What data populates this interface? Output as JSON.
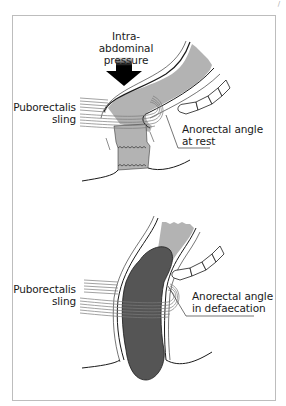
{
  "figure": {
    "corner_mark": "/",
    "colors": {
      "frame": "#bdbdbd",
      "rectum_fill": "#b3b3b3",
      "stool_fill": "#555555",
      "outline": "#1a1a1a",
      "muscle_stripe": "#8a8a8a",
      "background": "#ffffff"
    },
    "panels": [
      {
        "name": "at-rest",
        "labels": {
          "pressure_line1": "Intra-abdominal",
          "pressure_line2": "pressure",
          "sling_line1": "Puborectalis",
          "sling_line2": "sling",
          "angle_line1": "Anorectal angle",
          "angle_line2": "at rest"
        }
      },
      {
        "name": "defaecation",
        "labels": {
          "sling_line1": "Puborectalis",
          "sling_line2": "sling",
          "angle_line1": "Anorectal angle",
          "angle_line2": "in defaecation"
        }
      }
    ]
  }
}
